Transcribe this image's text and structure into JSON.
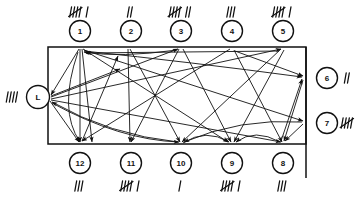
{
  "diagram": {
    "box": {
      "x": 48,
      "y": 47,
      "width": 258,
      "height": 97
    },
    "right_extension": {
      "x": 306,
      "y1": 47,
      "y2": 178
    },
    "colors": {
      "ink": "#111111",
      "paper": "#ffffff"
    },
    "nodes": [
      {
        "id": "1",
        "label": "1",
        "cx": 80,
        "cy": 31,
        "r": 10.5,
        "side": "top",
        "tally": "⥣∣",
        "tally_count": 6,
        "tally_x": 80,
        "tally_y": 12,
        "anchor_x": 80,
        "anchor_y": 47
      },
      {
        "id": "2",
        "label": "2",
        "cx": 131,
        "cy": 31,
        "r": 10.5,
        "side": "top",
        "tally": "∣∣",
        "tally_count": 2,
        "tally_x": 131,
        "tally_y": 12,
        "anchor_x": 131,
        "anchor_y": 47
      },
      {
        "id": "3",
        "label": "3",
        "cx": 181,
        "cy": 31,
        "r": 10.5,
        "side": "top",
        "tally": "⥣∣∣",
        "tally_count": 7,
        "tally_x": 181,
        "tally_y": 12,
        "anchor_x": 181,
        "anchor_y": 47
      },
      {
        "id": "4",
        "label": "4",
        "cx": 232,
        "cy": 31,
        "r": 10.5,
        "side": "top",
        "tally": "∣∣∣",
        "tally_count": 3,
        "tally_x": 232,
        "tally_y": 12,
        "anchor_x": 232,
        "anchor_y": 47
      },
      {
        "id": "5",
        "label": "5",
        "cx": 283,
        "cy": 31,
        "r": 10.5,
        "side": "top",
        "tally": "⥣∣",
        "tally_count": 6,
        "tally_x": 283,
        "tally_y": 12,
        "anchor_x": 283,
        "anchor_y": 47
      },
      {
        "id": "6",
        "label": "6",
        "cx": 327,
        "cy": 78,
        "r": 10.5,
        "side": "right",
        "tally": "∣∣",
        "tally_count": 2,
        "tally_x": 348,
        "tally_y": 78,
        "anchor_x": 306,
        "anchor_y": 78
      },
      {
        "id": "7",
        "label": "7",
        "cx": 327,
        "cy": 123,
        "r": 10.5,
        "side": "right",
        "tally": "⥣",
        "tally_count": 5,
        "tally_x": 348,
        "tally_y": 123,
        "anchor_x": 306,
        "anchor_y": 123
      },
      {
        "id": "8",
        "label": "8",
        "cx": 283,
        "cy": 163,
        "r": 10.5,
        "side": "bottom",
        "tally": "∣∣∣",
        "tally_count": 3,
        "tally_x": 283,
        "tally_y": 186,
        "anchor_x": 283,
        "anchor_y": 144
      },
      {
        "id": "9",
        "label": "9",
        "cx": 232,
        "cy": 163,
        "r": 10.5,
        "side": "bottom",
        "tally": "⥣∣",
        "tally_count": 6,
        "tally_x": 232,
        "tally_y": 186,
        "anchor_x": 232,
        "anchor_y": 144
      },
      {
        "id": "10",
        "label": "10",
        "cx": 181,
        "cy": 163,
        "r": 10.5,
        "side": "bottom",
        "tally": "∣",
        "tally_count": 1,
        "tally_x": 181,
        "tally_y": 186,
        "anchor_x": 181,
        "anchor_y": 144
      },
      {
        "id": "11",
        "label": "11",
        "cx": 131,
        "cy": 163,
        "r": 10.5,
        "side": "bottom",
        "tally": "⥣∣",
        "tally_count": 6,
        "tally_x": 131,
        "tally_y": 186,
        "anchor_x": 131,
        "anchor_y": 144
      },
      {
        "id": "12",
        "label": "12",
        "cx": 80,
        "cy": 163,
        "r": 10.5,
        "side": "bottom",
        "tally": "∣∣∣",
        "tally_count": 3,
        "tally_x": 80,
        "tally_y": 186,
        "anchor_x": 80,
        "anchor_y": 144
      },
      {
        "id": "L",
        "label": "L",
        "cx": 38,
        "cy": 97,
        "r": 11.5,
        "side": "left",
        "tally": "∣∣∣∣",
        "tally_count": 4,
        "tally_x": 13,
        "tally_y": 97,
        "anchor_x": 48,
        "anchor_y": 97
      }
    ],
    "flows": [
      {
        "from": "1",
        "to": "12",
        "kind": "straight",
        "path": "M 80 49 L 80 142"
      },
      {
        "from": "1",
        "to": "12",
        "kind": "straight",
        "path": "M 82 49 L 92 142"
      },
      {
        "from": "1",
        "to": "L",
        "kind": "straight",
        "path": "M 79 49 L 51 95"
      },
      {
        "from": "1",
        "to": "9",
        "kind": "straight",
        "path": "M 83 49 L 228 142"
      },
      {
        "from": "1",
        "to": "7",
        "kind": "straight",
        "path": "M 84 50 L 303 121"
      },
      {
        "from": "1",
        "to": "6",
        "kind": "curve",
        "path": "M 84 51 Q 190 62 302 77"
      },
      {
        "from": "1",
        "to": "12",
        "kind": "curve",
        "path": "M 78 52 Q 58 110 80 142"
      },
      {
        "from": "L",
        "to": "1",
        "kind": "straight",
        "path": "M 51 96 L 120 69"
      },
      {
        "from": "L",
        "to": "3",
        "kind": "straight",
        "path": "M 51 97 L 178 49"
      },
      {
        "from": "L",
        "to": "5",
        "kind": "straight",
        "path": "M 51 99 L 281 49"
      },
      {
        "from": "L",
        "to": "8",
        "kind": "straight",
        "path": "M 51 100 L 281 142"
      },
      {
        "from": "L",
        "to": "12",
        "kind": "straight",
        "path": "M 50 101 L 79 142"
      },
      {
        "from": "L",
        "to": "10",
        "kind": "curve",
        "path": "M 52 103 Q 120 140 179 142"
      },
      {
        "from": "2",
        "to": "10",
        "kind": "straight",
        "path": "M 130 49 L 180 142"
      },
      {
        "from": "2",
        "to": "11",
        "kind": "straight",
        "path": "M 128 49 L 130 142"
      },
      {
        "from": "3",
        "to": "11",
        "kind": "straight",
        "path": "M 179 49 L 131 142"
      },
      {
        "from": "3",
        "to": "9",
        "kind": "straight",
        "path": "M 183 49 L 231 142"
      },
      {
        "from": "3",
        "to": "12",
        "kind": "curve",
        "path": "M 177 50 Q 120 58 84 52"
      },
      {
        "from": "4",
        "to": "12",
        "kind": "straight",
        "path": "M 230 49 L 82 141"
      },
      {
        "from": "4",
        "to": "8",
        "kind": "straight",
        "path": "M 234 50 L 282 142"
      },
      {
        "from": "4",
        "to": "6",
        "kind": "straight",
        "path": "M 235 51 L 303 76"
      },
      {
        "from": "5",
        "to": "10",
        "kind": "straight",
        "path": "M 281 49 L 182 142"
      },
      {
        "from": "5",
        "to": "9",
        "kind": "straight",
        "path": "M 284 50 L 234 142"
      },
      {
        "from": "5",
        "to": "1",
        "kind": "straight",
        "path": "M 279 51 L 86 53"
      },
      {
        "from": "6",
        "to": "8",
        "kind": "straight",
        "path": "M 303 80 L 284 141"
      },
      {
        "from": "7",
        "to": "8",
        "kind": "straight",
        "path": "M 303 124 L 285 141"
      },
      {
        "from": "7",
        "to": "10",
        "kind": "curve",
        "path": "M 302 122 Q 240 118 184 142"
      },
      {
        "from": "8",
        "to": "6",
        "kind": "straight",
        "path": "M 281 141 L 302 79"
      },
      {
        "from": "8",
        "to": "9",
        "kind": "curve",
        "path": "M 280 142 Q 255 128 236 142"
      },
      {
        "from": "10",
        "to": "9",
        "kind": "curve",
        "path": "M 183 143 Q 206 128 229 142"
      },
      {
        "from": "10",
        "to": "L",
        "kind": "curve",
        "path": "M 178 142 Q 110 135 52 102"
      },
      {
        "from": "12",
        "to": "1",
        "kind": "straight",
        "path": "M 82 141 L 118 56"
      }
    ]
  }
}
